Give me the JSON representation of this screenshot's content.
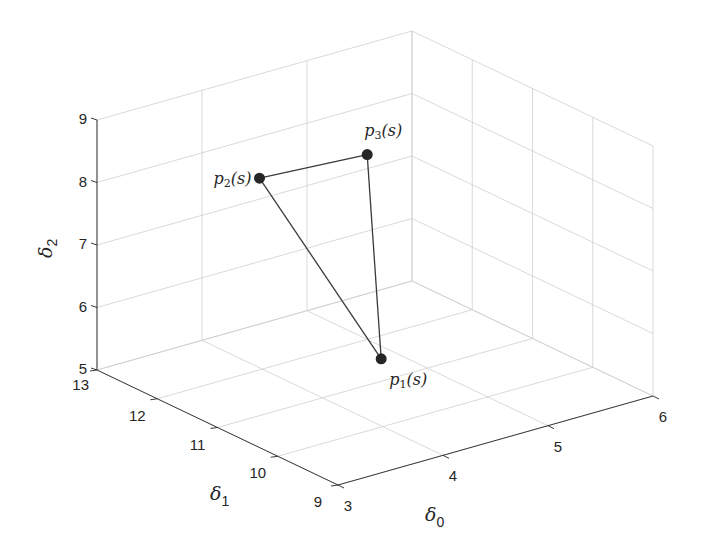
{
  "chart_data": {
    "type": "scatter3d",
    "title": "",
    "xlabel": "δ0",
    "ylabel": "δ1",
    "zlabel": "δ2",
    "axis_labels": {
      "x": {
        "base": "δ",
        "sub": "0"
      },
      "y": {
        "base": "δ",
        "sub": "1"
      },
      "z": {
        "base": "δ",
        "sub": "2"
      }
    },
    "xlim": [
      3,
      6
    ],
    "ylim": [
      9,
      13
    ],
    "zlim": [
      5,
      9
    ],
    "xticks": [
      3,
      4,
      5,
      6
    ],
    "yticks": [
      9,
      10,
      11,
      12,
      13
    ],
    "zticks": [
      5,
      6,
      7,
      8,
      9
    ],
    "grid": true,
    "box": true,
    "legend": null,
    "view": "3D perspective (MATLAB default-like azimuth/elevation)",
    "points": [
      {
        "name": "p1",
        "label_base": "p",
        "label_sub": "1",
        "label_tail": "(s)",
        "x": 4.84,
        "y": 11.49,
        "z": 5.0
      },
      {
        "name": "p2",
        "label_base": "p",
        "label_sub": "2",
        "label_tail": "(s)",
        "x": 3.4,
        "y": 11.0,
        "z": 8.8
      },
      {
        "name": "p3",
        "label_base": "p",
        "label_sub": "3",
        "label_tail": "(s)",
        "x": 4.77,
        "y": 11.6,
        "z": 8.25
      }
    ],
    "edges": [
      [
        "p2",
        "p3"
      ],
      [
        "p3",
        "p1"
      ],
      [
        "p1",
        "p2"
      ]
    ],
    "marker_color": "#262626",
    "line_color": "#3a3a3a"
  }
}
